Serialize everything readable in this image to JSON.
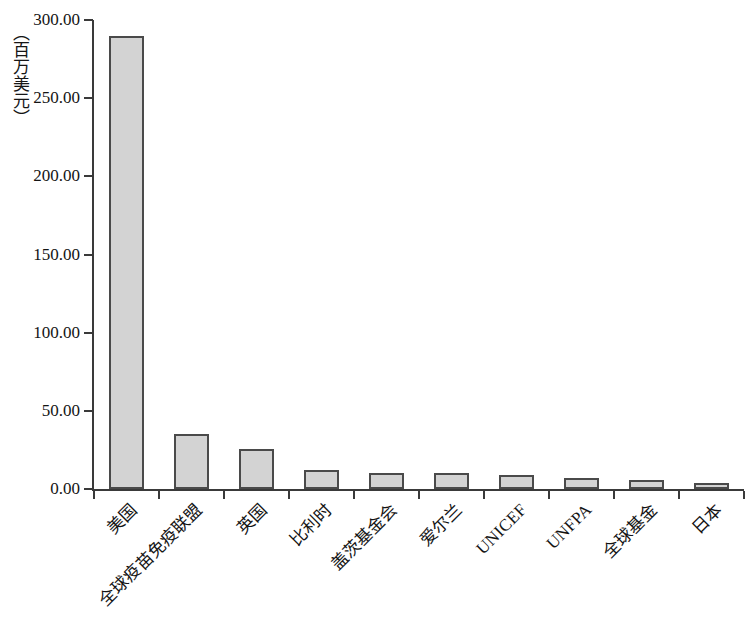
{
  "chart_data": {
    "type": "bar",
    "title": "",
    "subtitle": "",
    "xlabel": "",
    "ylabel": "（百万美元）",
    "ylim": [
      0,
      300
    ],
    "y_ticks": [
      "0.00",
      "50.00",
      "100.00",
      "150.00",
      "200.00",
      "250.00",
      "300.00"
    ],
    "y_tick_values": [
      0,
      50,
      100,
      150,
      200,
      250,
      300
    ],
    "grid": false,
    "legend": null,
    "categories": [
      "美国",
      "全球疫苗免疫联盟",
      "英国",
      "比利时",
      "盖茨基金会",
      "爱尔兰",
      "UNICEF",
      "UNFPA",
      "全球基金",
      "日本"
    ],
    "values": [
      290.0,
      35.0,
      25.5,
      12.0,
      10.5,
      10.0,
      9.0,
      7.0,
      6.0,
      4.0
    ],
    "series": [
      {
        "name": "",
        "values": [
          290.0,
          35.0,
          25.5,
          12.0,
          10.5,
          10.0,
          9.0,
          7.0,
          6.0,
          4.0
        ]
      }
    ],
    "bar_fill_color": "#d3d3d3",
    "bar_border_color": "#4a4a4a",
    "axis_color": "#3a3a3a",
    "background_color": "#ffffff"
  }
}
